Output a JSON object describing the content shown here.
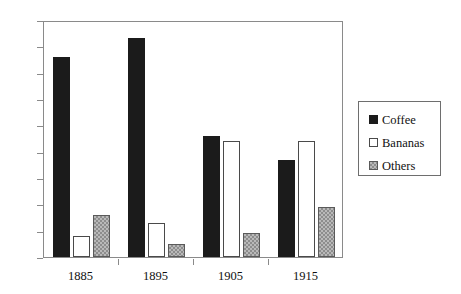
{
  "chart_data": {
    "type": "bar",
    "title": "",
    "subtitle": "",
    "xlabel": "",
    "ylabel": "",
    "categories": [
      "1885",
      "1895",
      "1905",
      "1915"
    ],
    "series": [
      {
        "name": "Coffee",
        "values": [
          76,
          83,
          46,
          37
        ],
        "color": "#1b1b1b",
        "fill": "solid-black"
      },
      {
        "name": "Bananas",
        "values": [
          8,
          13,
          44,
          44
        ],
        "color": "#ffffff",
        "fill": "white-outline"
      },
      {
        "name": "Others",
        "values": [
          16,
          5,
          9,
          19
        ],
        "color": "#b9b9b9",
        "fill": "gray-hatched"
      }
    ],
    "ylim": [
      0,
      90
    ],
    "ytick_step": 10,
    "yticks": [
      "90",
      "80",
      "70",
      "60",
      "50",
      "40",
      "30",
      "20",
      "10",
      "0"
    ],
    "grid": false,
    "legend_position": "right",
    "legend_entries": [
      "Coffee",
      "Bananas",
      "Others"
    ]
  },
  "axes": {
    "y_tick_labels": [
      "90",
      "80",
      "70",
      "60",
      "50",
      "40",
      "30",
      "20",
      "10",
      "0"
    ],
    "x_tick_labels": [
      "1885",
      "1895",
      "1905",
      "1915"
    ]
  },
  "legend": {
    "items": [
      {
        "label": "Coffee",
        "swatch": "solid-black-swatch"
      },
      {
        "label": "Bananas",
        "swatch": "white-outline-swatch"
      },
      {
        "label": "Others",
        "swatch": "gray-hatched-swatch"
      }
    ]
  }
}
